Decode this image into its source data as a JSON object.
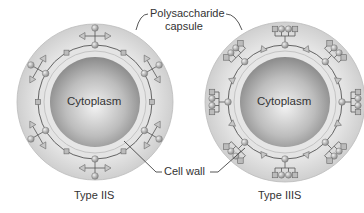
{
  "labels": {
    "capsule_line1": "Polysaccharide",
    "capsule_line2": "capsule",
    "cell_wall": "Cell wall",
    "cytoplasm_left": "Cytoplasm",
    "cytoplasm_right": "Cytoplasm",
    "type_left": "Type IIS",
    "type_right": "Type IIIS"
  },
  "colors": {
    "capsule": "#d8d8d8",
    "cell_wall": "#e2e2e2",
    "cytoplasm": "#a9a9a9",
    "chain": "#555555",
    "sugar": "#b5b5b5"
  }
}
